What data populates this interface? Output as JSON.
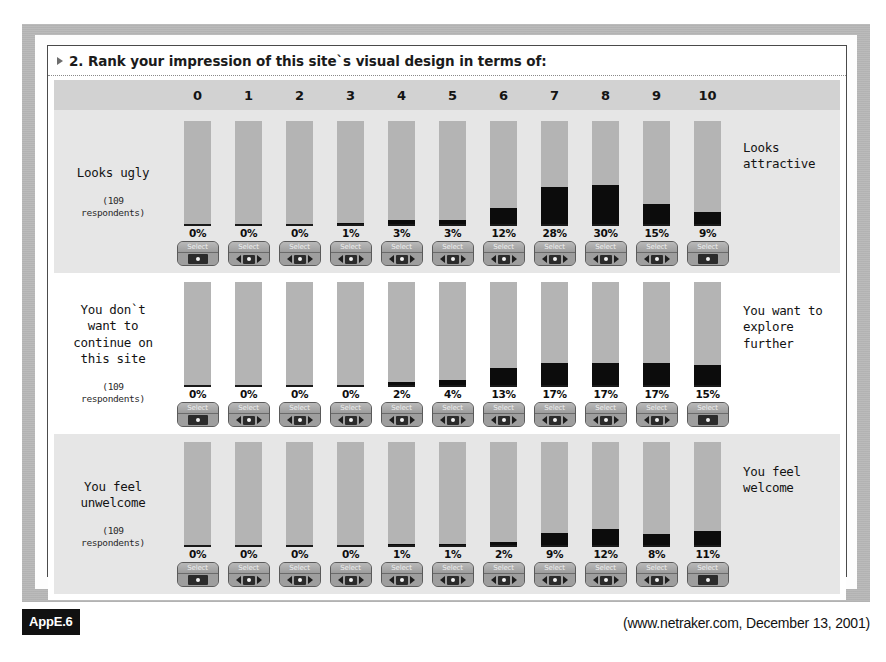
{
  "question": {
    "number_and_text": "2. Rank your impression of this site`s visual design in terms of:",
    "bullet_icon": "triangle-right-icon"
  },
  "scale": {
    "columns": [
      "0",
      "1",
      "2",
      "3",
      "4",
      "5",
      "6",
      "7",
      "8",
      "9",
      "10"
    ]
  },
  "selector": {
    "label": "Select",
    "left_arrow_icon": "arrow-left-icon",
    "right_arrow_icon": "arrow-right-icon",
    "knob_icon": "radio-dot-icon"
  },
  "footer": {
    "appendix_badge": "AppE.6",
    "source": "(www.netraker.com, December 13, 2001)"
  },
  "colors": {
    "bar_track": "#b4b4b4",
    "bar_fill": "#0c0c0c",
    "header_band": "#d2d2d2",
    "row_shade": "#e6e6e6",
    "outer_frame": "#b9b9b9"
  },
  "chart_data": {
    "type": "bar",
    "title": "2. Rank your impression of this site`s visual design in terms of:",
    "xlabel": "",
    "ylabel": "Percent of respondents",
    "ylim": [
      0,
      80
    ],
    "grid": false,
    "legend": "none",
    "categories": [
      "0",
      "1",
      "2",
      "3",
      "4",
      "5",
      "6",
      "7",
      "8",
      "9",
      "10"
    ],
    "units": "%",
    "respondents": "109",
    "series": [
      {
        "name": "Looks ugly ↔ Looks attractive",
        "left_anchor": "Looks ugly",
        "right_anchor": "Looks attractive",
        "respondents_note": "(109 respondents)",
        "values": [
          0,
          0,
          0,
          1,
          3,
          3,
          12,
          28,
          30,
          15,
          9
        ],
        "labels": [
          "0%",
          "0%",
          "0%",
          "1%",
          "3%",
          "3%",
          "12%",
          "28%",
          "30%",
          "15%",
          "9%"
        ]
      },
      {
        "name": "You don`t want to continue on this site ↔ You want to explore further",
        "left_anchor": "You don`t want to continue on this site",
        "right_anchor": "You want to explore further",
        "respondents_note": "(109 respondents)",
        "values": [
          0,
          0,
          0,
          0,
          2,
          4,
          13,
          17,
          17,
          17,
          15
        ],
        "labels": [
          "0%",
          "0%",
          "0%",
          "0%",
          "2%",
          "4%",
          "13%",
          "17%",
          "17%",
          "17%",
          "15%"
        ]
      },
      {
        "name": "You feel unwelcome ↔ You feel welcome",
        "left_anchor": "You feel unwelcome",
        "right_anchor": "You feel welcome",
        "respondents_note": "(109 respondents)",
        "values": [
          0,
          0,
          0,
          0,
          1,
          1,
          2,
          9,
          12,
          8,
          11
        ],
        "labels": [
          "0%",
          "0%",
          "0%",
          "0%",
          "1%",
          "1%",
          "2%",
          "9%",
          "12%",
          "8%",
          "11%"
        ]
      }
    ]
  },
  "rows": [
    {
      "left_lines": [
        "Looks ugly"
      ],
      "right_lines": [
        "Looks",
        "attractive"
      ],
      "respondents_note_lines": [
        "(109",
        "respondents)"
      ]
    },
    {
      "left_lines": [
        "You don`t",
        "want to",
        "continue on",
        "this site"
      ],
      "right_lines": [
        "You want to",
        "explore",
        "further"
      ],
      "respondents_note_lines": [
        "(109",
        "respondents)"
      ]
    },
    {
      "left_lines": [
        "You feel",
        "unwelcome"
      ],
      "right_lines": [
        "You feel",
        "welcome"
      ],
      "respondents_note_lines": [
        "(109",
        "respondents)"
      ]
    }
  ]
}
